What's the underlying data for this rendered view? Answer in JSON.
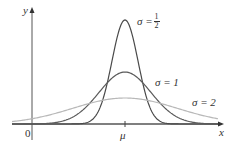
{
  "chart_data": {
    "type": "line",
    "title": "",
    "xlabel": "x",
    "ylabel": "y",
    "origin_label": "0",
    "x_tick_labels": [
      "μ"
    ],
    "grid": false,
    "legend": "inline labels next to curves",
    "series": [
      {
        "name": "σ = 1/2",
        "sigma": 0.5,
        "peak_height_rel": 1.0,
        "color": "#4a4a4a"
      },
      {
        "name": "σ = 1",
        "sigma": 1,
        "peak_height_rel": 0.5,
        "color": "#5a5a5a"
      },
      {
        "name": "σ = 2",
        "sigma": 2,
        "peak_height_rel": 0.25,
        "color": "#b8b8b8"
      }
    ]
  },
  "labels": {
    "y_axis": "y",
    "x_axis": "x",
    "origin": "0",
    "mu": "μ",
    "sigma_half_prefix": "σ = ",
    "sigma_half_num": "1",
    "sigma_half_den": "2",
    "sigma_one": "σ = 1",
    "sigma_two": "σ = 2"
  }
}
